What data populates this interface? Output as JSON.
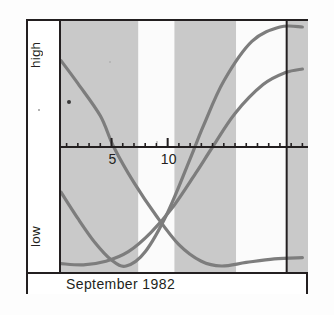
{
  "caption": {
    "text": "September 1982"
  },
  "axis": {
    "y_top_label": "high",
    "y_bottom_label": "low",
    "x_tick_labels": [
      "5",
      "10"
    ]
  },
  "colors": {
    "frame": "#231f20",
    "curve": "#7d7d7d",
    "band_shaded": "#c9c9c9",
    "band_light": "#fbfbfb",
    "background": "#ffffff",
    "tick": "#231f20"
  },
  "chart_data": {
    "type": "line",
    "title": "",
    "subtitle": "",
    "xlabel": "September 1982",
    "ylabel": "",
    "grid": false,
    "legend": "none",
    "xlim": [
      0.5,
      22.5
    ],
    "ylim": [
      -1,
      1
    ],
    "y_tick_labels": [
      "high",
      "low"
    ],
    "x_ticks": [
      1,
      2,
      3,
      4,
      5,
      6,
      7,
      8,
      9,
      10,
      11,
      12,
      13,
      14,
      15,
      16,
      17,
      18,
      19,
      20,
      21,
      22
    ],
    "x_tick_labels_shown": {
      "5": "5",
      "10": "10"
    },
    "shaded_bands": [
      {
        "from": 0.5,
        "to": 7.4,
        "shade": "shaded"
      },
      {
        "from": 7.4,
        "to": 10.6,
        "shade": "light"
      },
      {
        "from": 10.6,
        "to": 16.1,
        "shade": "shaded"
      },
      {
        "from": 16.1,
        "to": 20.6,
        "shade": "light"
      },
      {
        "from": 20.6,
        "to": 22.5,
        "shade": "shaded"
      }
    ],
    "series": [
      {
        "name": "physical",
        "points": [
          {
            "x": 0.5,
            "y": 0.72
          },
          {
            "x": 2.0,
            "y": 0.53
          },
          {
            "x": 4.0,
            "y": 0.26
          },
          {
            "x": 5.2,
            "y": 0.0
          },
          {
            "x": 7.0,
            "y": -0.3
          },
          {
            "x": 9.0,
            "y": -0.58
          },
          {
            "x": 11.0,
            "y": -0.82
          },
          {
            "x": 13.0,
            "y": -0.96
          },
          {
            "x": 14.8,
            "y": -1.0
          },
          {
            "x": 17.0,
            "y": -0.97
          },
          {
            "x": 19.5,
            "y": -0.94
          },
          {
            "x": 22.0,
            "y": -0.93
          }
        ]
      },
      {
        "name": "emotional",
        "points": [
          {
            "x": 0.5,
            "y": -0.38
          },
          {
            "x": 2.0,
            "y": -0.6
          },
          {
            "x": 3.5,
            "y": -0.8
          },
          {
            "x": 5.0,
            "y": -0.95
          },
          {
            "x": 6.3,
            "y": -1.0
          },
          {
            "x": 8.0,
            "y": -0.88
          },
          {
            "x": 10.0,
            "y": -0.55
          },
          {
            "x": 12.0,
            "y": -0.1
          },
          {
            "x": 13.2,
            "y": 0.18
          },
          {
            "x": 15.0,
            "y": 0.55
          },
          {
            "x": 17.5,
            "y": 0.88
          },
          {
            "x": 20.0,
            "y": 1.0
          },
          {
            "x": 22.0,
            "y": 1.0
          }
        ]
      },
      {
        "name": "intellectual",
        "points": [
          {
            "x": 0.5,
            "y": -0.98
          },
          {
            "x": 2.5,
            "y": -0.99
          },
          {
            "x": 4.5,
            "y": -0.96
          },
          {
            "x": 6.5,
            "y": -0.88
          },
          {
            "x": 8.5,
            "y": -0.72
          },
          {
            "x": 10.5,
            "y": -0.5
          },
          {
            "x": 12.5,
            "y": -0.22
          },
          {
            "x": 14.0,
            "y": 0.0
          },
          {
            "x": 16.0,
            "y": 0.28
          },
          {
            "x": 18.5,
            "y": 0.52
          },
          {
            "x": 20.5,
            "y": 0.62
          },
          {
            "x": 22.0,
            "y": 0.65
          }
        ]
      }
    ]
  }
}
